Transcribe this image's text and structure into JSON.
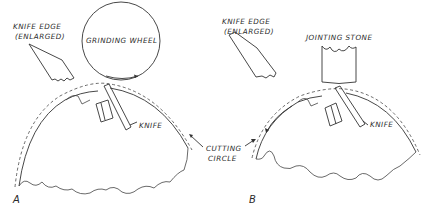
{
  "figure": {
    "panel_a": {
      "label": "A",
      "knife_edge_line1": "KNIFE EDGE",
      "knife_edge_line2": "(ENLARGED)",
      "tool_label": "GRINDING WHEEL",
      "knife_label": "KNIFE"
    },
    "panel_b": {
      "label": "B",
      "knife_edge_line1": "KNIFE EDGE",
      "knife_edge_line2": "(ENLARGED)",
      "tool_label": "JOINTING STONE",
      "knife_label": "KNIFE"
    },
    "shared": {
      "cutting_circle_line1": "CUTTING",
      "cutting_circle_line2": "CIRCLE"
    },
    "colors": {
      "line": "#333333",
      "background": "#ffffff"
    }
  }
}
